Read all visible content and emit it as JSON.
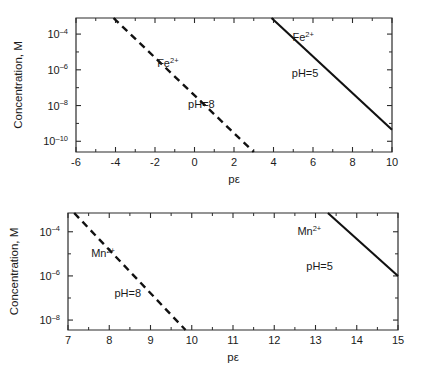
{
  "figure": {
    "background_color": "#ffffff",
    "line_color": "#111111",
    "axis_color": "#2b2b2b"
  },
  "panels": [
    {
      "id": "top",
      "ylabel": "Concentration, M",
      "xlabel": "pε",
      "y_tick_labels": [
        "10-4",
        "10-6",
        "10-8",
        "10-10"
      ],
      "x_tick_labels": [
        "-6",
        "-4",
        "-2",
        "0",
        "2",
        "4",
        "6",
        "8",
        "10"
      ],
      "annotations": [
        {
          "text": "Fe2+",
          "base": "Fe",
          "sup": "2+"
        },
        {
          "text": "pH=8"
        },
        {
          "text": "Fe2+",
          "base": "Fe",
          "sup": "2+"
        },
        {
          "text": "pH=5"
        }
      ]
    },
    {
      "id": "bottom",
      "ylabel": "Concentration, M",
      "xlabel": "pε",
      "y_tick_labels": [
        "10-4",
        "10-6",
        "10-8"
      ],
      "x_tick_labels": [
        "7",
        "8",
        "9",
        "10",
        "11",
        "12",
        "13",
        "14",
        "15"
      ],
      "annotations": [
        {
          "text": "Mn2+",
          "base": "Mn",
          "sup": "2+"
        },
        {
          "text": "pH=8"
        },
        {
          "text": "Mn2+",
          "base": "Mn",
          "sup": "2+"
        },
        {
          "text": "pH=5"
        }
      ]
    }
  ],
  "chart_data": [
    {
      "type": "line",
      "title": "",
      "xlabel": "pε",
      "ylabel": "Concentration, M",
      "xlim": [
        -6,
        10
      ],
      "ylim_log10": [
        -10.6,
        -3.1
      ],
      "yscale": "log",
      "grid": false,
      "legend": "inline-annotations",
      "x_ticks_major": [
        -6,
        -4,
        -2,
        0,
        2,
        4,
        6,
        8,
        10
      ],
      "x_ticks_minor": [
        -5,
        -3,
        -1,
        1,
        3,
        5,
        7,
        9
      ],
      "y_ticks_major_log10": [
        -4,
        -6,
        -8,
        -10
      ],
      "y_ticks_minor_log10": [
        -5,
        -7,
        -9
      ],
      "y_tick_labels": [
        "10⁻⁴",
        "10⁻⁶",
        "10⁻⁸",
        "10⁻¹⁰"
      ],
      "series": [
        {
          "name": "Fe2+ pH=8",
          "style": "dashed",
          "label": "Fe2+",
          "condition_label": "pH=8",
          "x": [
            -4.1,
            3.0
          ],
          "y_log10": [
            -3.1,
            -10.6
          ]
        },
        {
          "name": "Fe2+ pH=5",
          "style": "solid",
          "label": "Fe2+",
          "condition_label": "pH=5",
          "x": [
            3.9,
            10.0
          ],
          "y_log10": [
            -3.1,
            -9.35
          ]
        }
      ],
      "annotation_positions": [
        {
          "text": "Fe2+",
          "x": -1.35,
          "y_log10": -5.85
        },
        {
          "text": "pH=8",
          "x": 0.35,
          "y_log10": -8.15
        },
        {
          "text": "Fe2+",
          "x": 5.5,
          "y_log10": -4.4
        },
        {
          "text": "pH=5",
          "x": 5.6,
          "y_log10": -6.4
        }
      ]
    },
    {
      "type": "line",
      "title": "",
      "xlabel": "pε",
      "ylabel": "Concentration, M",
      "xlim": [
        7,
        15
      ],
      "ylim_log10": [
        -8.45,
        -3.15
      ],
      "yscale": "log",
      "grid": false,
      "legend": "inline-annotations",
      "x_ticks_major": [
        7,
        8,
        9,
        10,
        11,
        12,
        13,
        14,
        15
      ],
      "x_ticks_minor": [
        7.5,
        8.5,
        9.5,
        10.5,
        11.5,
        12.5,
        13.5,
        14.5
      ],
      "y_ticks_major_log10": [
        -4,
        -6,
        -8
      ],
      "y_ticks_minor_log10": [
        -5,
        -7
      ],
      "y_tick_labels": [
        "10⁻⁴",
        "10⁻⁶",
        "10⁻⁸"
      ],
      "series": [
        {
          "name": "Mn2+ pH=8",
          "style": "dashed",
          "label": "Mn2+",
          "condition_label": "pH=8",
          "x": [
            7.15,
            9.85
          ],
          "y_log10": [
            -3.15,
            -8.45
          ]
        },
        {
          "name": "Mn2+ pH=5",
          "style": "solid",
          "label": "Mn2+",
          "condition_label": "pH=5",
          "x": [
            13.3,
            15.0
          ],
          "y_log10": [
            -3.15,
            -6.0
          ]
        }
      ],
      "annotation_positions": [
        {
          "text": "Mn2+",
          "x": 7.85,
          "y_log10": -5.15
        },
        {
          "text": "pH=8",
          "x": 8.45,
          "y_log10": -6.95
        },
        {
          "text": "Mn2+",
          "x": 12.85,
          "y_log10": -4.15
        },
        {
          "text": "pH=5",
          "x": 13.1,
          "y_log10": -5.75
        }
      ]
    }
  ]
}
